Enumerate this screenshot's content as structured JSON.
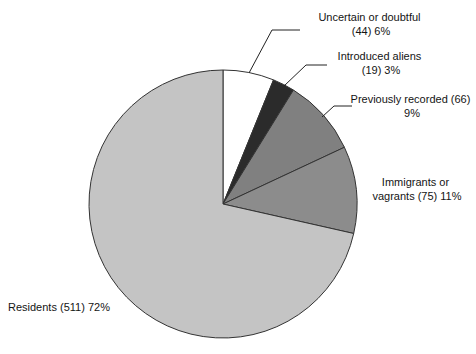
{
  "chart_data": {
    "type": "pie",
    "title": "",
    "subtitle": "",
    "xlabel": "",
    "ylabel": "",
    "legend_position": "none",
    "grid": false,
    "total_count": 715,
    "start_angle_deg": 0,
    "direction": "clockwise",
    "categories": [
      "Uncertain or doubtful",
      "Introduced aliens",
      "Previously recorded",
      "Immigrants or vagrants",
      "Residents"
    ],
    "values": [
      44,
      19,
      66,
      75,
      511
    ],
    "percentages": [
      6,
      3,
      9,
      11,
      72
    ],
    "colors": [
      "#ffffff",
      "#2b2b2b",
      "#808080",
      "#8c8c8c",
      "#c4c4c4"
    ],
    "slices": [
      {
        "name": "Uncertain or doubtful",
        "count": 44,
        "percent": 6,
        "color": "#ffffff",
        "label_line1": "Uncertain or doubtful",
        "label_line2": "(44) 6%"
      },
      {
        "name": "Introduced aliens",
        "count": 19,
        "percent": 3,
        "color": "#2b2b2b",
        "label_line1": "Introduced aliens",
        "label_line2": "(19) 3%"
      },
      {
        "name": "Previously recorded",
        "count": 66,
        "percent": 9,
        "color": "#808080",
        "label_line1": "Previously recorded (66)",
        "label_line2": "9%"
      },
      {
        "name": "Immigrants or vagrants",
        "count": 75,
        "percent": 11,
        "color": "#8c8c8c",
        "label_line1": "Immigrants or",
        "label_line2": "vagrants (75) 11%"
      },
      {
        "name": "Residents",
        "count": 511,
        "percent": 72,
        "color": "#c4c4c4",
        "label_line1": "Residents (511) 72%",
        "label_line2": ""
      }
    ]
  }
}
